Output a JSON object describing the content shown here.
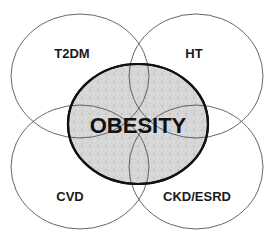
{
  "diagram": {
    "type": "venn",
    "center": {
      "label": "OBESITY",
      "fill": "#d4d4d4",
      "stroke": "#111111"
    },
    "satellites": [
      {
        "id": "t2dm",
        "label": "T2DM",
        "position": "top-left"
      },
      {
        "id": "ht",
        "label": "HT",
        "position": "top-right"
      },
      {
        "id": "cvd",
        "label": "CVD",
        "position": "bottom-left"
      },
      {
        "id": "ckd",
        "label": "CKD/ESRD",
        "position": "bottom-right"
      }
    ],
    "outline_color": "#555555",
    "background": "#ffffff"
  }
}
